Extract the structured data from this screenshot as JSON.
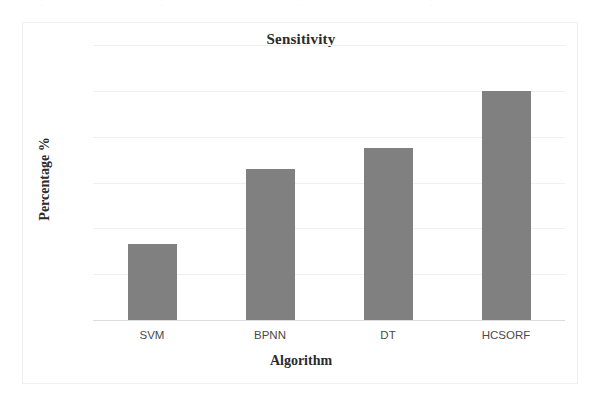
{
  "page": {
    "scan_artifact_visible": true
  },
  "chart_data": {
    "type": "bar",
    "title": "Sensitivity",
    "xlabel": "Algorithm",
    "ylabel": "Percentage %",
    "categories": [
      "SVM",
      "BPNN",
      "DT",
      "HCSORF"
    ],
    "values": [
      81.3,
      84.6,
      85.5,
      88.0
    ],
    "ylim": [
      78,
      90
    ],
    "ytick_labels": [
      "78",
      "80",
      "82",
      "84",
      "86",
      "88",
      "90"
    ],
    "ytick_values": [
      78,
      80,
      82,
      84,
      86,
      88,
      90
    ],
    "grid": true,
    "legend": "none",
    "bar_color": "#808080",
    "gridline_color": "#efefef",
    "text_color": "#2b2b2b"
  }
}
